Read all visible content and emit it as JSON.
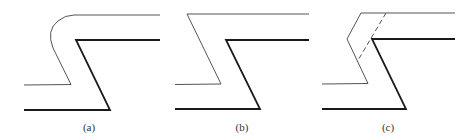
{
  "figure": {
    "panels": [
      {
        "id": "a",
        "label": "(a)",
        "description": "Upper thin line with rounded corner offset over bold Z-shaped step"
      },
      {
        "id": "b",
        "label": "(b)",
        "description": "Upper thin line with sharp corner offset over bold Z-shaped step"
      },
      {
        "id": "c",
        "label": "(c)",
        "description": "Upper thin line with chamfered corner, dashed construction line, over bold Z-shaped step"
      }
    ],
    "colors": {
      "thin_line": "#555555",
      "bold_line": "#1a1a1a",
      "dashed_line": "#555555",
      "background": "#ffffff"
    }
  }
}
